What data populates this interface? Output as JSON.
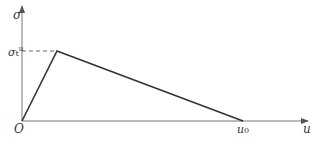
{
  "labels": {
    "y_axis": "σ",
    "x_axis": "u",
    "origin": "O",
    "peak_symbol": "σ",
    "peak_sub": "t",
    "peak_sup": "u",
    "end_symbol": "u",
    "end_sub": "0"
  },
  "colors": {
    "line": "#333333",
    "axis": "#666666"
  }
}
